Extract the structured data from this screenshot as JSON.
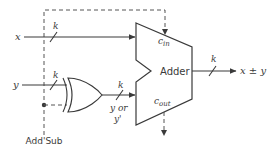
{
  "diagram": {
    "inputs": {
      "x": {
        "label": "x",
        "width_label": "k"
      },
      "y": {
        "label": "y",
        "width_label": "k"
      }
    },
    "control": {
      "label": "Add'Sub"
    },
    "xor_output": {
      "width_label": "k",
      "label_line1": "y or",
      "label_line2": "y'"
    },
    "adder": {
      "label": "Adder",
      "cin_label": "c",
      "cin_sub": "in",
      "cout_label": "c",
      "cout_sub": "out"
    },
    "output": {
      "width_label": "k",
      "label": "x ± y"
    },
    "colors": {
      "line": "#3a3a3a",
      "dashed": "#555555",
      "background": "#ffffff"
    }
  }
}
